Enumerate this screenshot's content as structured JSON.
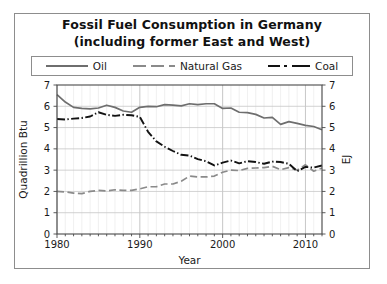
{
  "figure": {
    "title_line1": "Fossil Fuel Consumption in Germany",
    "title_line2": "(including former East and West)",
    "background": "#ffffff",
    "frame_color": "#8d8d8d"
  },
  "legend": {
    "position": "top",
    "entries": [
      {
        "label": "Oil",
        "style": "solid",
        "color": "#6e6e6e",
        "icon": "line-solid-icon"
      },
      {
        "label": "Natural Gas",
        "style": "dashed",
        "color": "#8a8a8a",
        "icon": "line-dashed-icon"
      },
      {
        "label": "Coal",
        "style": "dashdot",
        "color": "#121212",
        "icon": "line-dashdot-icon"
      }
    ]
  },
  "axes": {
    "x": {
      "label": "Year",
      "ticks": [
        "1980",
        "1990",
        "2000",
        "2010"
      ],
      "tick_values": [
        1980,
        1990,
        2000,
        2010
      ],
      "range": [
        1980,
        2012
      ],
      "minor_tick_step": 1
    },
    "y_left": {
      "label": "Quadrillion Btu",
      "ticks": [
        "0",
        "1",
        "2",
        "3",
        "4",
        "5",
        "6",
        "7"
      ],
      "tick_values": [
        0,
        1,
        2,
        3,
        4,
        5,
        6,
        7
      ],
      "range": [
        0,
        7
      ]
    },
    "y_right": {
      "label": "EJ",
      "ticks": [
        "0",
        "1",
        "2",
        "3",
        "4",
        "5",
        "6",
        "7"
      ],
      "tick_values": [
        0,
        1,
        2,
        3,
        4,
        5,
        6,
        7
      ],
      "range": [
        0,
        7
      ]
    }
  },
  "chart_data": {
    "type": "line",
    "title": "Fossil Fuel Consumption in Germany (including former East and West)",
    "xlabel": "Year",
    "ylabel": "Quadrillion Btu",
    "ylabel_secondary": "EJ",
    "xlim": [
      1980,
      2012
    ],
    "ylim": [
      0,
      7
    ],
    "grid": true,
    "legend_position": "top",
    "x": [
      1980,
      1981,
      1982,
      1983,
      1984,
      1985,
      1986,
      1987,
      1988,
      1989,
      1990,
      1991,
      1992,
      1993,
      1994,
      1995,
      1996,
      1997,
      1998,
      1999,
      2000,
      2001,
      2002,
      2003,
      2004,
      2005,
      2006,
      2007,
      2008,
      2009,
      2010,
      2011,
      2012
    ],
    "series": [
      {
        "name": "Oil",
        "style": "solid",
        "color": "#6e6e6e",
        "values": [
          6.55,
          6.2,
          5.95,
          5.9,
          5.88,
          5.92,
          6.05,
          5.95,
          5.78,
          5.72,
          5.95,
          6.0,
          5.98,
          6.08,
          6.05,
          6.02,
          6.12,
          6.08,
          6.12,
          6.12,
          5.9,
          5.92,
          5.72,
          5.7,
          5.62,
          5.45,
          5.48,
          5.15,
          5.28,
          5.2,
          5.1,
          5.05,
          4.9
        ]
      },
      {
        "name": "Natural Gas",
        "style": "dashed",
        "color": "#8a8a8a",
        "values": [
          2.0,
          1.98,
          1.92,
          1.9,
          2.0,
          2.05,
          2.02,
          2.08,
          2.05,
          2.05,
          2.12,
          2.22,
          2.22,
          2.35,
          2.35,
          2.48,
          2.72,
          2.68,
          2.68,
          2.72,
          2.9,
          3.0,
          2.98,
          3.08,
          3.1,
          3.12,
          3.18,
          3.02,
          3.12,
          3.0,
          3.25,
          2.95,
          3.1
        ]
      },
      {
        "name": "Coal",
        "style": "dashdot",
        "color": "#121212",
        "values": [
          5.4,
          5.38,
          5.42,
          5.45,
          5.52,
          5.72,
          5.6,
          5.55,
          5.6,
          5.58,
          5.5,
          4.8,
          4.35,
          4.1,
          3.9,
          3.72,
          3.68,
          3.52,
          3.42,
          3.22,
          3.35,
          3.45,
          3.32,
          3.42,
          3.38,
          3.3,
          3.4,
          3.38,
          3.3,
          2.95,
          3.15,
          3.12,
          3.22
        ]
      }
    ]
  }
}
